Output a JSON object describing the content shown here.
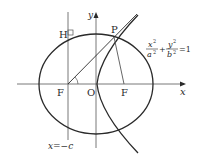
{
  "diagram": {
    "labels": {
      "x_axis": "x",
      "y_axis": "y",
      "origin": "O",
      "point_P": "P",
      "point_H": "H",
      "focus_left": "F",
      "focus_right": "F",
      "directrix": "x=−c"
    },
    "equation": {
      "x_num": "x",
      "x_den": "a",
      "y_num": "y",
      "y_den": "b",
      "exp": "2",
      "plus": "+",
      "rhs": "=1"
    },
    "colors": {
      "stroke": "#2a2a2a",
      "thin_stroke": "#555555",
      "background": "#ffffff"
    }
  }
}
